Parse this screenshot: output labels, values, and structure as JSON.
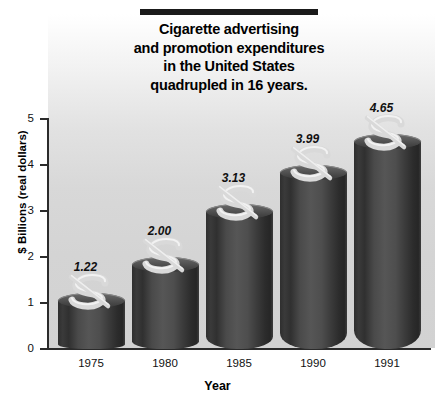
{
  "title": {
    "lines": [
      "Cigarette advertising",
      "and promotion expenditures",
      "in the United States",
      "quadrupled in 16 years."
    ]
  },
  "chart_data": {
    "type": "bar",
    "title": "Cigarette advertising and promotion expenditures in the United States quadrupled in 16 years.",
    "xlabel": "Year",
    "ylabel": "$ Billions (real dollars)",
    "categories": [
      "1975",
      "1980",
      "1985",
      "1990",
      "1991"
    ],
    "values": [
      1.22,
      2.0,
      3.13,
      3.99,
      4.65
    ],
    "value_labels": [
      "1.22",
      "2.00",
      "3.13",
      "3.99",
      "4.65"
    ],
    "ylim": [
      0,
      5
    ],
    "yticks": [
      0,
      1,
      2,
      3,
      4,
      5
    ],
    "ytick_labels": [
      "0",
      "1",
      "2",
      "3",
      "4",
      "5"
    ],
    "grid": false,
    "legend": false,
    "bar_style": "3d-cylinder-with-dollar-sign",
    "colors": {
      "bar_dark": "#2f2f2f",
      "bar_mid": "#565656",
      "bar_highlight": "#8a8a8a",
      "dollar_symbol": "#d9d9d9",
      "plot_background_top": "#ffffff",
      "plot_background_bottom": "#d2d2d2",
      "axis": "#2b2b2b",
      "text": "#000000"
    }
  },
  "axes": {
    "y_title": "$ Billions (real dollars)",
    "x_title": "Year",
    "y_ticks": [
      "5",
      "4",
      "3",
      "2",
      "1",
      "0"
    ],
    "x_ticks": [
      "1975",
      "1980",
      "1985",
      "1990",
      "1991"
    ]
  }
}
